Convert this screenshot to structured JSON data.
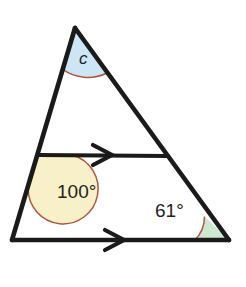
{
  "figure": {
    "background_color": "#ffffff",
    "stroke_color": "#1a1a1a",
    "arc_color": "#b4563c",
    "text_color": "#231f20"
  },
  "vertices": {
    "apex": {
      "name": "apex",
      "x": 75,
      "y": 28
    },
    "bottom_left": {
      "name": "bottom-left",
      "x": 12,
      "y": 240
    },
    "bottom_right": {
      "name": "bottom-right",
      "x": 229,
      "y": 240
    },
    "midline_left": {
      "name": "midline-left",
      "x": 38,
      "y": 155
    },
    "midline_right": {
      "name": "midline-right",
      "x": 168,
      "y": 156
    }
  },
  "segments": [
    {
      "name": "left-side",
      "from": "apex",
      "to": "bottom_left",
      "path": "M 75 28 L 12 240"
    },
    {
      "name": "right-side",
      "from": "apex",
      "to": "bottom_right",
      "path": "M 75 28 L 229 240"
    },
    {
      "name": "base",
      "from": "bottom_left",
      "to": "bottom_right",
      "path": "M 12 240 L 229 240"
    },
    {
      "name": "transversal",
      "from": "midline_left",
      "to": "midline_right",
      "path": "M 38 155 L 168 156"
    }
  ],
  "parallel_marks": [
    {
      "name": "transversal-arrow",
      "x": 103,
      "y": 155,
      "glyph": "single-chevron-right"
    },
    {
      "name": "base-arrow",
      "x": 115,
      "y": 240,
      "glyph": "single-chevron-right"
    }
  ],
  "angles": [
    {
      "id": "apex-angle",
      "label": "c",
      "fill": "#cde6f5",
      "arc_color": "#b4563c",
      "vertex": "apex",
      "label_x": 79,
      "label_y": 64,
      "sector_path": "M 75 28 L 62.7 69.4 A 43.2 43.2 0 0 0 106.4 73.2 Z",
      "arc_path": "M 62.7 69.4 A 43.2 43.2 0 0 0 106.4 73.2"
    },
    {
      "id": "lower-left-interior-angle",
      "label": "100°",
      "fill": "#f7f0c8",
      "arc_color": "#b4563c",
      "vertex": "midline_left",
      "label_x": 57,
      "label_y": 198,
      "sector_path": "M 38 155 L 73 155.3 A 35 35 0 1 1 28.1 188.6 Z",
      "arc_path": "M 73 155.3 A 35 35 0 1 1 28.1 188.6"
    },
    {
      "id": "bottom-right-angle",
      "label": "61°",
      "fill": "#cce8d0",
      "arc_color": "#b4563c",
      "vertex": "bottom_right",
      "label_x": 155,
      "label_y": 217,
      "sector_path": "M 229 240 L 195 240 A 34 34 0 0 0 204.5 216.4 Z",
      "arc_path": "M 195 240 A 34 34 0 0 0 204.5 216.4"
    }
  ]
}
